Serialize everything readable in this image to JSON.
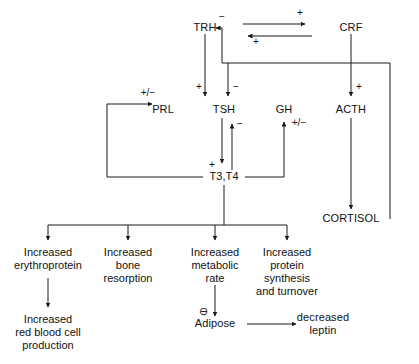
{
  "diagram": {
    "line_color": "#1a1a1a",
    "text_color": "#111111",
    "background": "#ffffff",
    "nodes": [
      {
        "id": "trh",
        "label": "TRH",
        "x": 205,
        "y": 28
      },
      {
        "id": "crf",
        "label": "CRF",
        "x": 351,
        "y": 28
      },
      {
        "id": "prl",
        "label": "PRL",
        "x": 163,
        "y": 110
      },
      {
        "id": "tsh",
        "label": "TSH",
        "x": 224,
        "y": 110
      },
      {
        "id": "gh",
        "label": "GH",
        "x": 284,
        "y": 110
      },
      {
        "id": "acth",
        "label": "ACTH",
        "x": 351,
        "y": 110
      },
      {
        "id": "t3t4",
        "label": "T3,T4",
        "x": 224,
        "y": 177
      },
      {
        "id": "cortisol",
        "label": "CORTISOL",
        "x": 351,
        "y": 219
      },
      {
        "id": "adipose",
        "label": "Adipose",
        "x": 215,
        "y": 324
      },
      {
        "id": "leptin",
        "label": "decreased\nleptin",
        "x": 323,
        "y": 318
      }
    ],
    "signs": [
      {
        "id": "sign-trh-from-cortisol",
        "label": "−",
        "x": 222,
        "y": 17
      },
      {
        "id": "sign-top-right-arrow",
        "label": "+",
        "x": 300,
        "y": 13
      },
      {
        "id": "sign-top-left-arrow",
        "label": "+",
        "x": 256,
        "y": 41
      },
      {
        "id": "sign-crf-to-acth",
        "label": "+",
        "x": 357,
        "y": 86
      },
      {
        "id": "sign-trh-to-tsh",
        "label": "+",
        "x": 211,
        "y": 87
      },
      {
        "id": "sign-cortisol-to-tsh",
        "label": "−",
        "x": 235,
        "y": 87
      },
      {
        "id": "sign-t3t4-to-tsh",
        "label": "−",
        "x": 235,
        "y": 124
      },
      {
        "id": "sign-t3t4-to-prl",
        "label": "+/−",
        "x": 148,
        "y": 90
      },
      {
        "id": "sign-t3t4-to-gh",
        "label": "+/−",
        "x": 300,
        "y": 122
      },
      {
        "id": "sign-tsh-to-t3t4",
        "label": "+",
        "x": 212,
        "y": 163
      },
      {
        "id": "sign-adipose",
        "label": "⊖",
        "x": 203,
        "y": 311
      }
    ],
    "outcomes": [
      {
        "id": "outcome-erythroprotein",
        "label": "Increased\nerythroprotein",
        "x": 48,
        "y": 246
      },
      {
        "id": "outcome-bone-resorption",
        "label": "Increased\nbone\nresorption",
        "x": 128,
        "y": 246
      },
      {
        "id": "outcome-metabolic-rate",
        "label": "Increased\nmetabolic\nrate",
        "x": 215,
        "y": 246
      },
      {
        "id": "outcome-protein",
        "label": "Increased\nprotein\nsynthesis\nand turnover",
        "x": 287,
        "y": 246
      },
      {
        "id": "outcome-rbc",
        "label": "Increased\nred blood cell\nproduction",
        "x": 48,
        "y": 313
      }
    ]
  }
}
